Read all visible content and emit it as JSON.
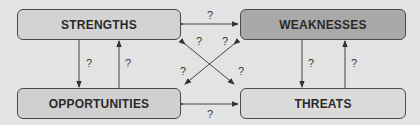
{
  "diagram": {
    "colors": {
      "background": "#e3e3e3",
      "strengths": "#d3d3d3",
      "weaknesses": "#a9a9a9",
      "opportunities": "#d0d0d0",
      "threats": "#dadada",
      "stroke": "#4a4a4a"
    },
    "boxes": {
      "strengths": "STRENGTHS",
      "weaknesses": "WEAKNESSES",
      "opportunities": "OPPORTUNITIES",
      "threats": "THREATS"
    },
    "connections": [
      {
        "id": "strengths-weaknesses",
        "from": "strengths",
        "to": "weaknesses",
        "direction": "both",
        "label": "?"
      },
      {
        "id": "opportunities-threats",
        "from": "opportunities",
        "to": "threats",
        "direction": "both",
        "label": "?"
      },
      {
        "id": "strengths-to-opportunities",
        "from": "strengths",
        "to": "opportunities",
        "direction": "forward",
        "label": "?"
      },
      {
        "id": "opportunities-to-strengths",
        "from": "opportunities",
        "to": "strengths",
        "direction": "forward",
        "label": "?"
      },
      {
        "id": "weaknesses-to-threats",
        "from": "weaknesses",
        "to": "threats",
        "direction": "forward",
        "label": "?"
      },
      {
        "id": "threats-to-weaknesses",
        "from": "threats",
        "to": "weaknesses",
        "direction": "forward",
        "label": "?"
      },
      {
        "id": "strengths-threats",
        "from": "strengths",
        "to": "threats",
        "direction": "both",
        "label_start": "?",
        "label_end": "?"
      },
      {
        "id": "weaknesses-opportunities",
        "from": "weaknesses",
        "to": "opportunities",
        "direction": "both",
        "label_start": "?",
        "label_end": "?"
      }
    ]
  }
}
